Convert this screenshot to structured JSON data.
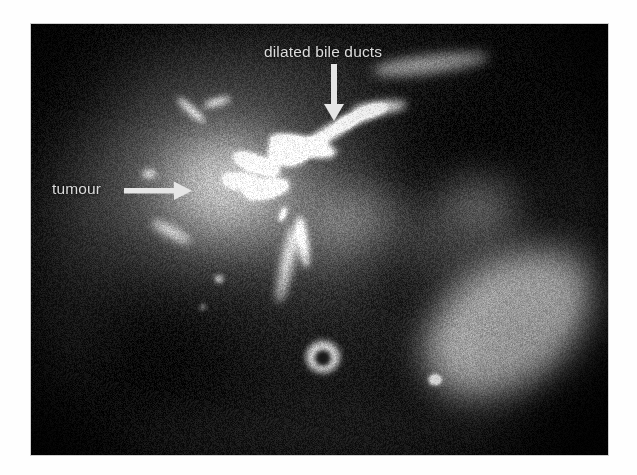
{
  "figure": {
    "kind": "medical-image-figure",
    "modality_appearance": "MRCP / heavily T2-weighted axial abdominal MRI slice",
    "page_background": "#ffffff",
    "panel": {
      "x": 31,
      "y": 24,
      "width": 577,
      "height": 431,
      "background": "#050505",
      "border_color": "#cfcfcf"
    }
  },
  "annotations": {
    "text_color": "#dcdcdc",
    "arrow_color": "#e6e6e6",
    "items": [
      {
        "id": "dilated-bile-ducts",
        "label": "dilated bile ducts",
        "label_x": 264,
        "label_y": 44,
        "arrow": {
          "direction": "down",
          "from_x": 334,
          "from_y": 66,
          "to_x": 334,
          "to_y": 120
        }
      },
      {
        "id": "tumour",
        "label": "tumour",
        "label_x": 52,
        "label_y": 181,
        "arrow": {
          "direction": "right",
          "from_x": 126,
          "from_y": 191,
          "to_x": 192,
          "to_y": 191
        }
      }
    ]
  },
  "scan_features": {
    "noise": {
      "dot_count": 5200,
      "seed": 20240917,
      "base_level": 10
    },
    "soft_regions": [
      {
        "name": "liver-parenchyma",
        "cx": 210,
        "cy": 140,
        "rx": 150,
        "ry": 105,
        "level": 46,
        "blur": 34
      },
      {
        "name": "liver-right-lobe",
        "cx": 130,
        "cy": 175,
        "rx": 105,
        "ry": 95,
        "level": 38,
        "blur": 36
      },
      {
        "name": "tumour-mass",
        "cx": 205,
        "cy": 160,
        "rx": 86,
        "ry": 66,
        "level": 54,
        "blur": 26
      },
      {
        "name": "tumour-core",
        "cx": 196,
        "cy": 158,
        "rx": 52,
        "ry": 40,
        "level": 60,
        "blur": 20
      },
      {
        "name": "spleen",
        "cx": 480,
        "cy": 300,
        "rx": 104,
        "ry": 70,
        "level": 82,
        "blur": 16,
        "rotate": -36
      },
      {
        "name": "spleen-inner",
        "cx": 478,
        "cy": 300,
        "rx": 86,
        "ry": 54,
        "level": 92,
        "blur": 14,
        "rotate": -36
      },
      {
        "name": "left-kidney",
        "cx": 430,
        "cy": 205,
        "rx": 62,
        "ry": 46,
        "level": 56,
        "blur": 22,
        "rotate": -25
      },
      {
        "name": "kidney-hilum",
        "cx": 452,
        "cy": 180,
        "rx": 34,
        "ry": 26,
        "level": 48,
        "blur": 18
      },
      {
        "name": "stomach-duodenum",
        "cx": 300,
        "cy": 215,
        "rx": 60,
        "ry": 52,
        "level": 40,
        "blur": 26
      },
      {
        "name": "pancreas-head",
        "cx": 330,
        "cy": 195,
        "rx": 42,
        "ry": 30,
        "level": 52,
        "blur": 18,
        "rotate": -18
      },
      {
        "name": "retroperitoneal-fat",
        "cx": 300,
        "cy": 300,
        "rx": 120,
        "ry": 70,
        "level": 22,
        "blur": 34
      },
      {
        "name": "anterior-body-wall",
        "cx": 260,
        "cy": 40,
        "rx": 190,
        "ry": 30,
        "level": 24,
        "blur": 28
      },
      {
        "name": "posterior-body-wall",
        "cx": 290,
        "cy": 412,
        "rx": 210,
        "ry": 26,
        "level": 26,
        "blur": 26
      },
      {
        "name": "left-flank",
        "cx": 546,
        "cy": 230,
        "rx": 40,
        "ry": 120,
        "level": 20,
        "blur": 30
      },
      {
        "name": "right-flank",
        "cx": 40,
        "cy": 250,
        "rx": 38,
        "ry": 120,
        "level": 20,
        "blur": 30
      }
    ],
    "bright_structures": [
      {
        "name": "bile-duct-trunk",
        "cx": 272,
        "cy": 122,
        "rx": 34,
        "ry": 9,
        "level": 236,
        "blur": 3,
        "rotate": 12
      },
      {
        "name": "bile-duct-confluence",
        "cx": 258,
        "cy": 128,
        "rx": 20,
        "ry": 13,
        "level": 244,
        "blur": 3
      },
      {
        "name": "bile-duct-right-branch",
        "cx": 300,
        "cy": 108,
        "rx": 30,
        "ry": 7,
        "level": 230,
        "blur": 3,
        "rotate": -30
      },
      {
        "name": "bile-duct-right-branch-2",
        "cx": 330,
        "cy": 92,
        "rx": 26,
        "ry": 6,
        "level": 222,
        "blur": 3,
        "rotate": -22
      },
      {
        "name": "bile-duct-upper-arc",
        "cx": 348,
        "cy": 84,
        "rx": 28,
        "ry": 6,
        "level": 214,
        "blur": 4,
        "rotate": -8
      },
      {
        "name": "bile-duct-left-branch",
        "cx": 226,
        "cy": 140,
        "rx": 24,
        "ry": 7,
        "level": 226,
        "blur": 3,
        "rotate": 20
      },
      {
        "name": "bile-duct-left-lower",
        "cx": 212,
        "cy": 158,
        "rx": 20,
        "ry": 6,
        "level": 210,
        "blur": 3,
        "rotate": 10
      },
      {
        "name": "bile-duct-inferior-cluster",
        "cx": 236,
        "cy": 165,
        "rx": 22,
        "ry": 8,
        "level": 218,
        "blur": 3,
        "rotate": -12
      },
      {
        "name": "peripheral-duct-1",
        "cx": 160,
        "cy": 86,
        "rx": 18,
        "ry": 4,
        "level": 176,
        "blur": 3,
        "rotate": 42
      },
      {
        "name": "peripheral-duct-2",
        "cx": 186,
        "cy": 78,
        "rx": 14,
        "ry": 4,
        "level": 168,
        "blur": 3,
        "rotate": -16
      },
      {
        "name": "peripheral-duct-3",
        "cx": 118,
        "cy": 150,
        "rx": 7,
        "ry": 4,
        "level": 158,
        "blur": 3
      },
      {
        "name": "peripheral-duct-4",
        "cx": 140,
        "cy": 208,
        "rx": 22,
        "ry": 5,
        "level": 140,
        "blur": 4,
        "rotate": 28
      },
      {
        "name": "vessel-descending",
        "cx": 256,
        "cy": 240,
        "rx": 6,
        "ry": 40,
        "level": 150,
        "blur": 4,
        "rotate": 12
      },
      {
        "name": "vessel-descending-2",
        "cx": 272,
        "cy": 218,
        "rx": 5,
        "ry": 26,
        "level": 168,
        "blur": 3,
        "rotate": -8
      },
      {
        "name": "aorta-ring-outer",
        "cx": 292,
        "cy": 333,
        "rx": 17,
        "ry": 16,
        "level": 196,
        "blur": 3
      },
      {
        "name": "aorta-ring-inner",
        "cx": 292,
        "cy": 334,
        "rx": 8,
        "ry": 8,
        "level": 14,
        "blur": 2
      },
      {
        "name": "splenic-focus",
        "cx": 404,
        "cy": 356,
        "rx": 6,
        "ry": 5,
        "level": 252,
        "blur": 2
      },
      {
        "name": "anterior-bright-streak",
        "cx": 400,
        "cy": 40,
        "rx": 58,
        "ry": 9,
        "level": 150,
        "blur": 6,
        "rotate": -7
      },
      {
        "name": "tiny-focus-1",
        "cx": 188,
        "cy": 255,
        "rx": 4,
        "ry": 4,
        "level": 150,
        "blur": 2
      },
      {
        "name": "tiny-focus-2",
        "cx": 172,
        "cy": 283,
        "rx": 3,
        "ry": 3,
        "level": 130,
        "blur": 2
      },
      {
        "name": "tiny-focus-3",
        "cx": 252,
        "cy": 190,
        "rx": 3,
        "ry": 8,
        "level": 160,
        "blur": 2,
        "rotate": 20
      }
    ]
  }
}
